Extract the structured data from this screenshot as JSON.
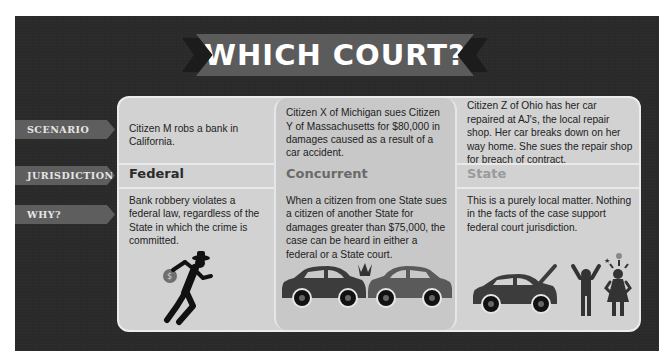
{
  "title": "WHICH COURT?",
  "row_labels": {
    "scenario": "SCENARIO",
    "jurisdiction": "JURISDICTION",
    "why": "WHY?"
  },
  "columns": [
    {
      "scenario": "Citizen M robs a bank in California.",
      "jurisdiction": "Federal",
      "jurisdiction_color": "#2b2b2b",
      "why": "Bank robbery violates a federal law, regardless of the State in which the crime is committed.",
      "icon": "robber-with-money-bag-icon"
    },
    {
      "scenario": "Citizen X of Michigan sues Citizen Y of Massachusetts for $80,000 in damages caused as a result of a car accident.",
      "jurisdiction": "Concurrent",
      "jurisdiction_color": "#6a6a6a",
      "why": "When a citizen from one State sues a citizen of another State for damages greater than $75,000, the case can be heard in either a federal or a State court.",
      "icon": "car-crash-icon"
    },
    {
      "scenario": "Citizen Z of Ohio has her car repaired at AJ's, the local repair shop. Her car breaks down on her way home. She sues the repair shop for breach of contract.",
      "jurisdiction": "State",
      "jurisdiction_color": "#9a9a9a",
      "why": "This is a purely local matter. Nothing in the facts of the case support federal court jurisdiction.",
      "icon": "broken-car-and-angry-people-icon"
    }
  ],
  "colors": {
    "background": "#2a2a2a",
    "card": "#d2d2d2",
    "card_middle": "#c8c8c8",
    "label_tab": "#5e5e5e",
    "banner": "#5b5b5b"
  }
}
